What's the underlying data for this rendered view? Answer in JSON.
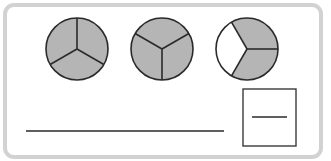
{
  "diagram": {
    "type": "fraction-circles",
    "colors": {
      "shaded": "#b5b5b5",
      "unshaded": "#ffffff",
      "stroke": "#2a2a2a",
      "frame": "#d2d2d2"
    },
    "circles": [
      {
        "id": "circle-1",
        "parts": 3,
        "shaded_parts": 3,
        "center": [
          77,
          49
        ],
        "radius": 31,
        "divider_angles_deg": [
          90,
          210,
          330
        ]
      },
      {
        "id": "circle-2",
        "parts": 3,
        "shaded_parts": 3,
        "center": [
          162,
          49
        ],
        "radius": 31,
        "divider_angles_deg": [
          270,
          30,
          150
        ]
      },
      {
        "id": "circle-3",
        "parts": 3,
        "shaded_parts": 2,
        "center": [
          247,
          49
        ],
        "radius": 31,
        "divider_angles_deg": [
          0,
          120,
          240
        ],
        "unshaded_region": "left third"
      }
    ],
    "answer_line": {
      "x1": 26,
      "y1": 131,
      "x2": 224,
      "y2": 131,
      "value": ""
    },
    "fraction_box": {
      "x": 243,
      "y": 89,
      "width": 53,
      "height": 57,
      "bar": {
        "x1": 252,
        "x2": 287,
        "y": 117
      },
      "numerator": "",
      "denominator": ""
    }
  }
}
